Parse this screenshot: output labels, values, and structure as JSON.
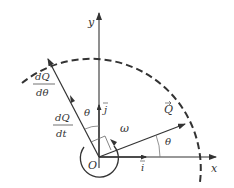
{
  "diagram": {
    "axes": {
      "x_label": "x",
      "y_label": "y",
      "origin_label": "O"
    },
    "unit_vectors": {
      "i": "i",
      "j": "j"
    },
    "vectors": {
      "Q": "Q",
      "dQ_dtheta_num": "dQ",
      "dQ_dtheta_den": "dθ",
      "dQ_dt_num": "dQ",
      "dQ_dt_den": "dt"
    },
    "angles": {
      "theta_x": "θ",
      "theta_y": "θ"
    },
    "rotation": {
      "omega": "ω"
    },
    "colors": {
      "line": "#333333",
      "background": "#ffffff"
    }
  }
}
